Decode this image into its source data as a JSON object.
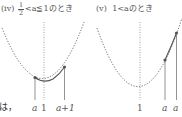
{
  "side_text": "は，",
  "panels": [
    {
      "id": "iv",
      "marker": "(iv)",
      "condition_prefix_num": "1",
      "condition_prefix_den": "2",
      "condition_rest": "<a≦1のとき",
      "labels": {
        "a": "a",
        "axis": "1",
        "a_plus_1": "a+1"
      }
    },
    {
      "id": "v",
      "marker": "(v)",
      "condition": "1<aのとき",
      "labels": {
        "axis": "1",
        "a": "a",
        "a_plus_1": "a"
      }
    }
  ],
  "colors": {
    "curve": "#555555",
    "dotted": "#666666",
    "text": "#555555"
  }
}
